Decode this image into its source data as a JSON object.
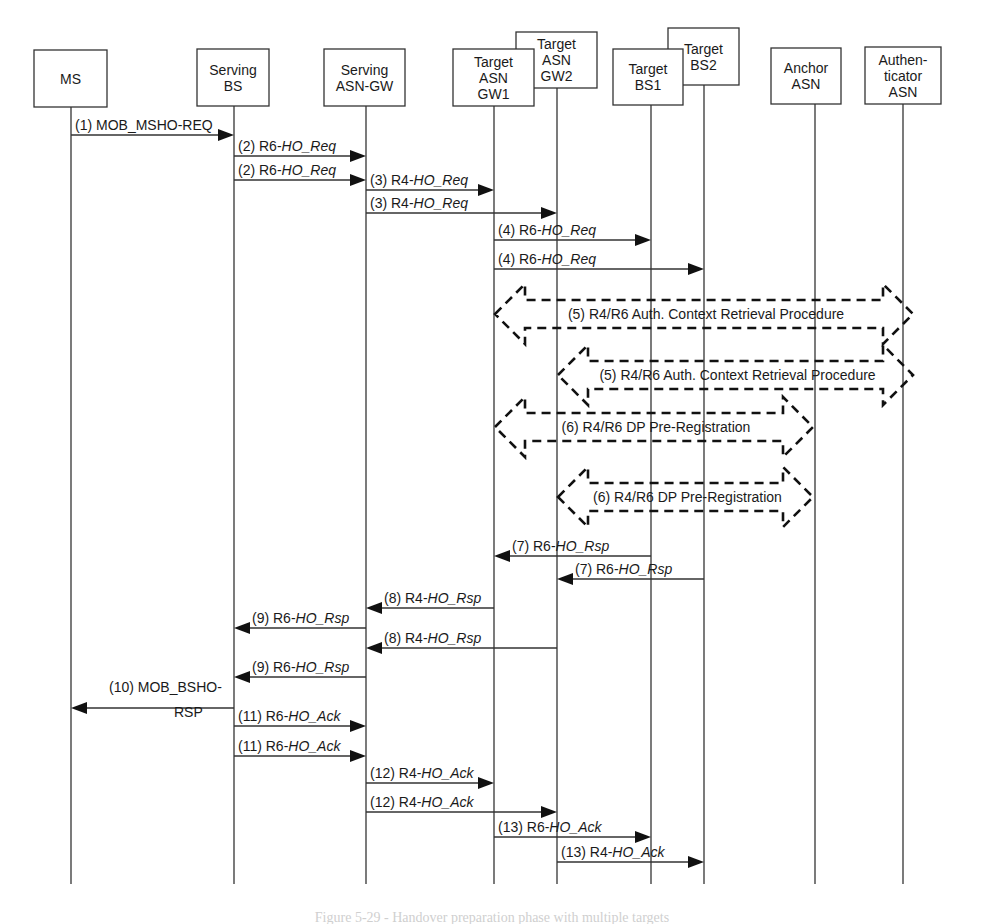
{
  "diagram": {
    "type": "sequence-diagram",
    "entities": [
      {
        "id": "ms",
        "lines": [
          "MS"
        ],
        "x": 71,
        "box": [
          34,
          50,
          73,
          57
        ]
      },
      {
        "id": "serving-bs",
        "lines": [
          "Serving",
          "BS"
        ],
        "x": 234,
        "box": [
          197,
          49,
          72,
          57
        ]
      },
      {
        "id": "serving-asn-gw",
        "lines": [
          "Serving",
          "ASN-GW"
        ],
        "x": 366,
        "box": [
          324,
          49,
          81,
          57
        ]
      },
      {
        "id": "target-asn-gw2",
        "lines": [
          "Target",
          "ASN",
          "GW2"
        ],
        "x": 557,
        "box": [
          516,
          32,
          81,
          56
        ]
      },
      {
        "id": "target-asn-gw1",
        "lines": [
          "Target",
          "ASN",
          "GW1"
        ],
        "x": 494,
        "box": [
          453,
          49,
          81,
          57
        ]
      },
      {
        "id": "target-bs2",
        "lines": [
          "Target",
          "BS2"
        ],
        "x": 704,
        "box": [
          668,
          28,
          71,
          57
        ]
      },
      {
        "id": "target-bs1",
        "lines": [
          "Target",
          "BS1"
        ],
        "x": 651,
        "box": [
          613,
          49,
          70,
          56
        ]
      },
      {
        "id": "anchor-asn",
        "lines": [
          "Anchor",
          "ASN"
        ],
        "x": 815,
        "box": [
          771,
          48,
          70,
          56
        ]
      },
      {
        "id": "authenticator-asn",
        "lines": [
          "Authen-",
          "ticator",
          "ASN"
        ],
        "x": 903,
        "box": [
          865,
          47,
          76,
          57
        ]
      }
    ],
    "lifeline_end_y": 884,
    "messages": [
      {
        "step": "(1)",
        "prefix": "MOB_MSHO-REQ",
        "italic": "",
        "from": "ms",
        "to": "serving-bs",
        "y": 135
      },
      {
        "step": "(2)",
        "prefix": "R6-",
        "italic": "HO_Req",
        "from": "serving-bs",
        "to": "serving-asn-gw",
        "y": 156
      },
      {
        "step": "(2)",
        "prefix": "R6-",
        "italic": "HO_Req",
        "from": "serving-bs",
        "to": "serving-asn-gw",
        "y": 180
      },
      {
        "step": "(3)",
        "prefix": "R4-",
        "italic": "HO_Req",
        "from": "serving-asn-gw",
        "to": "target-asn-gw1",
        "y": 190
      },
      {
        "step": "(3)",
        "prefix": "R4-",
        "italic": "HO_Req",
        "from": "serving-asn-gw",
        "to": "target-asn-gw2",
        "y": 213
      },
      {
        "step": "(4)",
        "prefix": "R6-",
        "italic": "HO_Req",
        "from": "target-asn-gw1",
        "to": "target-bs1",
        "y": 240
      },
      {
        "step": "(4)",
        "prefix": "R6-",
        "italic": "HO_Req",
        "from": "target-asn-gw1",
        "to": "target-bs2",
        "y": 269
      },
      {
        "step": "(7)",
        "prefix": "R6-",
        "italic": "HO_Rsp",
        "from": "target-bs1",
        "to": "target-asn-gw1",
        "y": 556
      },
      {
        "step": "(7)",
        "prefix": "R6-",
        "italic": "HO_Rsp",
        "from": "target-bs2",
        "to": "target-asn-gw2",
        "y": 579
      },
      {
        "step": "(8)",
        "prefix": "R4-",
        "italic": "HO_Rsp",
        "from": "target-asn-gw1",
        "to": "serving-asn-gw",
        "y": 608
      },
      {
        "step": "(9)",
        "prefix": "R6-",
        "italic": "HO_Rsp",
        "from": "serving-asn-gw",
        "to": "serving-bs",
        "y": 628
      },
      {
        "step": "(8)",
        "prefix": "R4-",
        "italic": "HO_Rsp",
        "from": "target-asn-gw2",
        "to": "serving-asn-gw",
        "y": 648
      },
      {
        "step": "(9)",
        "prefix": "R6-",
        "italic": "HO_Rsp",
        "from": "serving-asn-gw",
        "to": "serving-bs",
        "y": 677
      },
      {
        "step": "(10)",
        "prefix": "MOB_BSHO-",
        "prefix2": "RSP",
        "italic": "",
        "from": "serving-bs",
        "to": "ms",
        "y": 708
      },
      {
        "step": "(11)",
        "prefix": "R6-",
        "italic": "HO_Ack",
        "from": "serving-bs",
        "to": "serving-asn-gw",
        "y": 726
      },
      {
        "step": "(11)",
        "prefix": "R6-",
        "italic": "HO_Ack",
        "from": "serving-bs",
        "to": "serving-asn-gw",
        "y": 756
      },
      {
        "step": "(12)",
        "prefix": "R4-",
        "italic": "HO_Ack",
        "from": "serving-asn-gw",
        "to": "target-asn-gw1",
        "y": 783
      },
      {
        "step": "(12)",
        "prefix": "R4-",
        "italic": "HO_Ack",
        "from": "serving-asn-gw",
        "to": "target-asn-gw2",
        "y": 812
      },
      {
        "step": "(13)",
        "prefix": "R6-",
        "italic": "HO_Ack",
        "from": "target-asn-gw1",
        "to": "target-bs1",
        "y": 837
      },
      {
        "step": "(13)",
        "prefix": "R4-",
        "italic": "HO_Ack",
        "from": "target-asn-gw2",
        "to": "target-bs2",
        "y": 862
      }
    ],
    "procedures": [
      {
        "label": "(5) R4/R6 Auth. Context Retrieval Procedure",
        "x1": 495,
        "x2": 913,
        "y": 314
      },
      {
        "label": "(5) R4/R6 Auth. Context Retrieval Procedure",
        "x1": 558,
        "x2": 913,
        "y": 375
      },
      {
        "label": "(6) R4/R6 DP Pre-Registration",
        "x1": 495,
        "x2": 813,
        "y": 427
      },
      {
        "label": "(6) R4/R6 DP Pre-Registration",
        "x1": 558,
        "x2": 813,
        "y": 497
      }
    ],
    "caption": "Figure 5-29 - Handover preparation phase with multiple targets"
  }
}
